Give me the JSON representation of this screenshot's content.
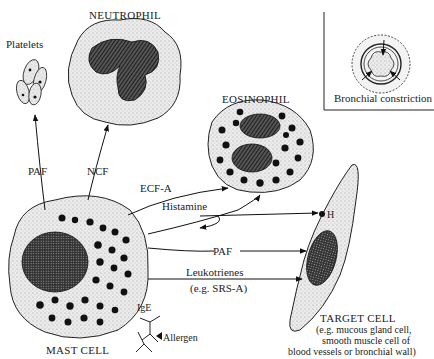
{
  "cells": {
    "neutrophil": {
      "label": "NEUTROPHIL"
    },
    "platelets": {
      "label": "Platelets"
    },
    "eosinophil": {
      "label": "EOSINOPHIL"
    },
    "mast_cell": {
      "label": "MAST CELL"
    },
    "target_cell": {
      "label": "TARGET CELL",
      "description_lines": [
        "(e.g. mucous gland cell,",
        "smooth muscle cell of",
        "blood vessels or bronchial wall)"
      ],
      "receptor_label": "H"
    }
  },
  "inset": {
    "caption": "Bronchial constriction"
  },
  "mediators": {
    "paf_to_platelets": "PAF",
    "ncf": "NCF",
    "ecf_a": "ECF-A",
    "histamine": "Histamine",
    "paf_to_target": "PAF",
    "leukotrienes": "Leukotrienes",
    "leukotrienes_example": "(e.g. SRS-A)"
  },
  "antibody": {
    "ige": "IgE",
    "allergen": "Allergen"
  },
  "colors": {
    "ink": "#1a1a1a",
    "stipple": "#e4e4e4",
    "background": "#ffffff"
  }
}
